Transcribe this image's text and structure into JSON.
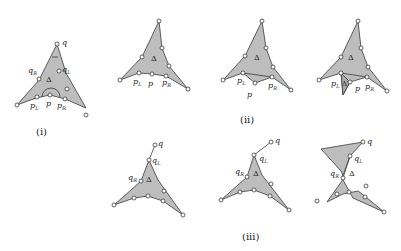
{
  "figure": {
    "captions": {
      "i": "(i)",
      "ii": "(ii)",
      "iii": "(iii)"
    },
    "labels": {
      "q": "q",
      "qL": "q",
      "qR": "q",
      "p": "p",
      "pL": "p",
      "pR": "p",
      "L": "L",
      "R": "R",
      "delta": "Δ",
      "delta_prime": "Δ′"
    },
    "colors": {
      "fill": "#bdbdbd",
      "stroke": "#3a3a3a",
      "vertex": "#ffffff"
    },
    "panels": [
      {
        "id": "i",
        "description": "Triangle Δ with apex q, points q_L, q_R on sides, p, p_L, p_R on bottom with arc at p"
      },
      {
        "id": "ii-a",
        "description": "Triangle Δ with p_L, p, p_R on bottom edge"
      },
      {
        "id": "ii-b",
        "description": "Triangle Δ with p pushed below p_L–p_R segment"
      },
      {
        "id": "ii-c",
        "description": "Triangle Δ with additional triangle Δ′ below p_L"
      },
      {
        "id": "iii-a",
        "description": "Triangle with q outside, connected to q_L"
      },
      {
        "id": "iii-b",
        "description": "Triangle with q further out to upper right"
      },
      {
        "id": "iii-c",
        "description": "Triangle with extra polygon flap from q toward upper left"
      }
    ]
  }
}
